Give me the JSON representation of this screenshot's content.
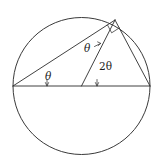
{
  "figure": {
    "type": "geometry-diagram",
    "canvas": {
      "width": 163,
      "height": 167,
      "background": "#ffffff"
    },
    "stroke_color": "#2b2b2b",
    "circle_color": "#3a3a3a",
    "circle": {
      "center_x": 81.5,
      "center_y": 86,
      "radius": 68.5
    },
    "points": {
      "left_vertex": {
        "x": 13,
        "y": 86,
        "name": "A"
      },
      "center": {
        "x": 81.5,
        "y": 86,
        "name": "O"
      },
      "right_vertex": {
        "x": 150,
        "y": 86,
        "name": "B"
      },
      "apex": {
        "x": 115,
        "y": 20,
        "name": "C"
      }
    },
    "segments": [
      {
        "name": "diameter",
        "from": "left_vertex",
        "to": "right_vertex"
      },
      {
        "name": "chord-left-apex",
        "from": "left_vertex",
        "to": "apex"
      },
      {
        "name": "radius-center-apex",
        "from": "center",
        "to": "apex"
      },
      {
        "name": "chord-apex-right",
        "from": "apex",
        "to": "right_vertex"
      }
    ],
    "right_angle_marker": {
      "at": "apex",
      "size": 9,
      "name": "right-angle-square"
    },
    "labels": [
      {
        "id": "theta-left",
        "text": "θ",
        "x": 49,
        "y": 77,
        "italic": true,
        "describes": "inscribed angle at left vertex"
      },
      {
        "id": "theta-apex",
        "text": "θ",
        "x": 88,
        "y": 49,
        "italic": true,
        "describes": "base angle at apex in isosceles triangle"
      },
      {
        "id": "two-theta-center",
        "text": "2θ",
        "x": 104,
        "y": 67,
        "italic": false,
        "describes": "central angle at circle center"
      }
    ],
    "angle_ticks": [
      {
        "id": "tick-left",
        "x": 47,
        "y": 86,
        "height": 7
      },
      {
        "id": "tick-center",
        "x": 93,
        "y": 86,
        "height": 7
      }
    ]
  }
}
